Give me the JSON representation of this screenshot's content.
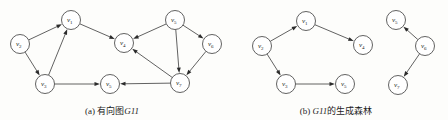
{
  "figure": {
    "background_color": "#fdfdfb",
    "stroke_color": "#3a3a3a",
    "label_color": "#1d1d1d",
    "width": 448,
    "height": 120
  },
  "panels": [
    {
      "id": "panel-a",
      "caption_prefix": "(a)",
      "caption_text": "有向图",
      "caption_italic": "G11",
      "caption_full": "(a) 有向图G11",
      "nodes": [
        {
          "id": "v1",
          "label": "v",
          "sub": "1",
          "x": 71,
          "y": 20
        },
        {
          "id": "v2",
          "label": "v",
          "sub": "2",
          "x": 20,
          "y": 44
        },
        {
          "id": "v3",
          "label": "v",
          "sub": "3",
          "x": 45,
          "y": 84
        },
        {
          "id": "v4",
          "label": "v",
          "sub": "4",
          "x": 124,
          "y": 43
        },
        {
          "id": "v5",
          "label": "v",
          "sub": "5",
          "x": 175,
          "y": 20
        },
        {
          "id": "v6",
          "label": "v",
          "sub": "6",
          "x": 212,
          "y": 44
        },
        {
          "id": "v7",
          "label": "v",
          "sub": "7",
          "x": 180,
          "y": 83
        },
        {
          "id": "v5b",
          "label": "v",
          "sub": "5",
          "x": 110,
          "y": 84
        }
      ],
      "edges": [
        {
          "from": "v2",
          "to": "v1",
          "directed": true
        },
        {
          "from": "v2",
          "to": "v3",
          "directed": true
        },
        {
          "from": "v3",
          "to": "v1",
          "directed": true
        },
        {
          "from": "v1",
          "to": "v4",
          "directed": true
        },
        {
          "from": "v3",
          "to": "v5b",
          "directed": true
        },
        {
          "from": "v7",
          "to": "v5b",
          "directed": true
        },
        {
          "from": "v5",
          "to": "v4",
          "directed": true
        },
        {
          "from": "v5",
          "to": "v6",
          "directed": true
        },
        {
          "from": "v5",
          "to": "v7",
          "directed": true
        },
        {
          "from": "v6",
          "to": "v7",
          "directed": true
        },
        {
          "from": "v7",
          "to": "v4",
          "directed": true
        }
      ]
    },
    {
      "id": "panel-b",
      "caption_prefix": "(b)",
      "caption_italic": "G11",
      "caption_text": "的生成森林",
      "caption_full": "(b) G11的生成森林",
      "nodes": [
        {
          "id": "v1",
          "label": "v",
          "sub": "1",
          "x": 306,
          "y": 21
        },
        {
          "id": "v2",
          "label": "v",
          "sub": "2",
          "x": 262,
          "y": 46
        },
        {
          "id": "v3",
          "label": "v",
          "sub": "3",
          "x": 286,
          "y": 84
        },
        {
          "id": "v4",
          "label": "v",
          "sub": "4",
          "x": 363,
          "y": 45
        },
        {
          "id": "v5",
          "label": "v",
          "sub": "5",
          "x": 345,
          "y": 84
        },
        {
          "id": "v5t",
          "label": "v",
          "sub": "5",
          "x": 396,
          "y": 20
        },
        {
          "id": "v6",
          "label": "v",
          "sub": "6",
          "x": 425,
          "y": 46
        },
        {
          "id": "v7",
          "label": "v",
          "sub": "7",
          "x": 398,
          "y": 85
        }
      ],
      "edges": [
        {
          "from": "v2",
          "to": "v1",
          "directed": true
        },
        {
          "from": "v1",
          "to": "v4",
          "directed": true
        },
        {
          "from": "v2",
          "to": "v3",
          "directed": true
        },
        {
          "from": "v3",
          "to": "v5",
          "directed": true
        },
        {
          "from": "v6",
          "to": "v5t",
          "directed": true
        },
        {
          "from": "v6",
          "to": "v7",
          "directed": true
        }
      ]
    }
  ],
  "node_radius": 9.5
}
